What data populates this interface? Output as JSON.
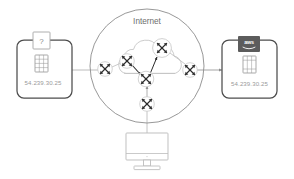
{
  "diagram": {
    "background_color": "#ffffff",
    "line_color": "#b4b4b4",
    "box_border_color": "#4d4d4d",
    "text_color": "#9a9a9a",
    "cloud_label_color": "#6e6e6e"
  },
  "cloud": {
    "label": "Internet",
    "circle_stroke": "#8c8c8c",
    "inner_cloud_stroke": "#c3c3c3"
  },
  "left_node": {
    "name": "unknown-host",
    "ip": "54.239.30.25",
    "badge": {
      "type": "question-badge",
      "label": "?",
      "fill": "#ffffff",
      "stroke": "#9a9a9a"
    },
    "icon": "server-instance-icon"
  },
  "right_node": {
    "name": "aws-instance",
    "ip": "54.239.30.25",
    "badge": {
      "type": "aws-logo-badge",
      "label": "aws",
      "fill": "#5c5c5c",
      "text_color": "#ffffff"
    },
    "icon": "server-instance-icon"
  },
  "workstation": {
    "name": "desktop-monitor",
    "icon": "monitor-icon"
  },
  "routers": [
    {
      "id": "router-west",
      "label": "router-west",
      "cx": 105,
      "cy": 69
    },
    {
      "id": "router-northwest",
      "label": "router-northwest",
      "cx": 127,
      "cy": 61
    },
    {
      "id": "router-north",
      "label": "router-north",
      "cx": 162,
      "cy": 48
    },
    {
      "id": "router-center",
      "label": "router-center",
      "cx": 146,
      "cy": 79
    },
    {
      "id": "router-east",
      "label": "router-east",
      "cx": 190,
      "cy": 70
    },
    {
      "id": "router-south",
      "label": "router-south",
      "cx": 147,
      "cy": 104
    }
  ],
  "links": [
    {
      "from": "left-node",
      "to": "router-west",
      "arrow": false
    },
    {
      "from": "router-east",
      "to": "right-node",
      "arrow": true
    },
    {
      "from": "router-west",
      "to": "router-northwest",
      "arrow": false
    },
    {
      "from": "router-northwest",
      "to": "router-center",
      "arrow": true
    },
    {
      "from": "router-north",
      "to": "router-center",
      "arrow": true
    },
    {
      "from": "router-north",
      "to": "router-east",
      "arrow": false
    },
    {
      "from": "router-center",
      "to": "router-south",
      "arrow": true
    },
    {
      "from": "router-south",
      "to": "workstation",
      "arrow": false
    }
  ]
}
